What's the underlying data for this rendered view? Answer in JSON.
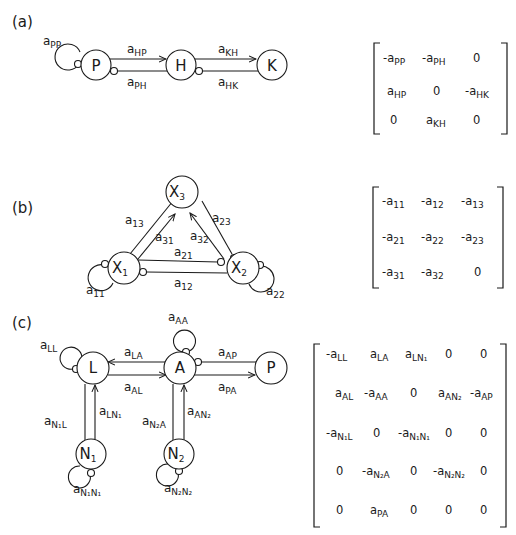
{
  "panels": [
    {
      "label": "(a)",
      "nodes": [
        "P",
        "H",
        "K"
      ],
      "edges": [
        {
          "from": "P",
          "to": "P",
          "label": "a",
          "sub": "PP",
          "type": "negative-self-loop"
        },
        {
          "from": "P",
          "to": "H",
          "label": "a",
          "sub": "HP",
          "type": "positive"
        },
        {
          "from": "H",
          "to": "P",
          "label": "a",
          "sub": "PH",
          "type": "negative"
        },
        {
          "from": "H",
          "to": "K",
          "label": "a",
          "sub": "KH",
          "type": "positive"
        },
        {
          "from": "K",
          "to": "H",
          "label": "a",
          "sub": "HK",
          "type": "negative"
        }
      ],
      "matrix": [
        [
          "-a_PP",
          "-a_PH",
          "0"
        ],
        [
          "a_HP",
          "0",
          "-a_HK"
        ],
        [
          "0",
          "a_KH",
          "0"
        ]
      ]
    },
    {
      "label": "(b)",
      "nodes": [
        "X3",
        "X1",
        "X2"
      ],
      "node_display": {
        "X1": {
          "main": "X",
          "sub": "1"
        },
        "X2": {
          "main": "X",
          "sub": "2"
        },
        "X3": {
          "main": "X",
          "sub": "3"
        }
      },
      "edges": [
        {
          "label": "a",
          "sub": "11"
        },
        {
          "label": "a",
          "sub": "22"
        },
        {
          "label": "a",
          "sub": "13"
        },
        {
          "label": "a",
          "sub": "31"
        },
        {
          "label": "a",
          "sub": "23"
        },
        {
          "label": "a",
          "sub": "32"
        },
        {
          "label": "a",
          "sub": "21"
        },
        {
          "label": "a",
          "sub": "12"
        }
      ],
      "matrix": [
        [
          "-a_11",
          "-a_12",
          "-a_13"
        ],
        [
          "-a_21",
          "-a_22",
          "-a_23"
        ],
        [
          "-a_31",
          "-a_32",
          "0"
        ]
      ]
    },
    {
      "label": "(c)",
      "nodes": [
        "L",
        "A",
        "P",
        "N1",
        "N2"
      ],
      "node_display": {
        "N1": {
          "main": "N",
          "sub": "1"
        },
        "N2": {
          "main": "N",
          "sub": "2"
        }
      },
      "edges": [
        {
          "label": "a",
          "sub": "LL"
        },
        {
          "label": "a",
          "sub": "AA"
        },
        {
          "label": "a",
          "sub": "LA"
        },
        {
          "label": "a",
          "sub": "AL"
        },
        {
          "label": "a",
          "sub": "AP"
        },
        {
          "label": "a",
          "sub": "PA"
        },
        {
          "label": "a",
          "sub": "N₁L"
        },
        {
          "label": "a",
          "sub": "LN₁"
        },
        {
          "label": "a",
          "sub": "N₂A"
        },
        {
          "label": "a",
          "sub": "AN₂"
        },
        {
          "label": "a",
          "sub": "N₁N₁"
        },
        {
          "label": "a",
          "sub": "N₂N₂"
        }
      ],
      "matrix": [
        [
          "-a_LL",
          "a_LA",
          "a_LN1",
          "0",
          "0"
        ],
        [
          "a_AL",
          "-a_AA",
          "0",
          "a_AN2",
          "-a_AP"
        ],
        [
          "-a_N1L",
          "0",
          "-a_N1N1",
          "0",
          "0"
        ],
        [
          "0",
          "-a_N2A",
          "0",
          "-a_N2N2",
          "0"
        ],
        [
          "0",
          "a_PA",
          "0",
          "0",
          "0"
        ]
      ]
    }
  ],
  "text": {
    "a": "a",
    "zero": "0",
    "neg_a": "-a",
    "P": "P",
    "H": "H",
    "K": "K",
    "X": "X",
    "L": "L",
    "A": "A",
    "N": "N",
    "s1": "1",
    "s2": "2",
    "s3": "3",
    "PP": "PP",
    "HP": "HP",
    "PH": "PH",
    "KH": "KH",
    "HK": "HK",
    "11": "11",
    "12": "12",
    "13": "13",
    "21": "21",
    "22": "22",
    "23": "23",
    "31": "31",
    "32": "32",
    "LL": "LL",
    "AA": "AA",
    "LA": "LA",
    "AL": "AL",
    "AP": "AP",
    "PA": "PA",
    "N1L": "N₁L",
    "LN1": "LN₁",
    "N2A": "N₂A",
    "AN2": "AN₂",
    "N1N1": "N₁N₁",
    "N2N2": "N₂N₂",
    "panel_a": "(a)",
    "panel_b": "(b)",
    "panel_c": "(c)"
  }
}
